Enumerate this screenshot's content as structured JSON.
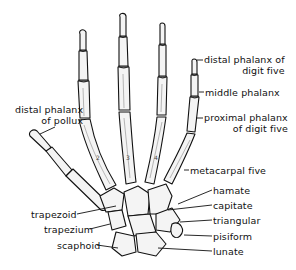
{
  "diagram": {
    "labels": [
      {
        "id": "distal-phalanx-digit-five",
        "line1": "distal phalanx of",
        "line2": "digit five",
        "x": 204,
        "y": 54
      },
      {
        "id": "middle-phalanx",
        "line1": "middle phalanx",
        "line2": "",
        "x": 205,
        "y": 87
      },
      {
        "id": "proximal-phalanx-digit-five",
        "line1": "proximal phalanx",
        "line2": "of digit five",
        "x": 204,
        "y": 112
      },
      {
        "id": "distal-phalanx-pollux",
        "line1": "distal phalanx",
        "line2": "of pollux",
        "x": 15,
        "y": 104
      },
      {
        "id": "metacarpal-five",
        "line1": "metacarpal five",
        "line2": "",
        "x": 190,
        "y": 165
      },
      {
        "id": "hamate",
        "line1": "hamate",
        "line2": "",
        "x": 213,
        "y": 185
      },
      {
        "id": "capitate",
        "line1": "capitate",
        "line2": "",
        "x": 213,
        "y": 200
      },
      {
        "id": "triangular",
        "line1": "triangular",
        "line2": "",
        "x": 213,
        "y": 215
      },
      {
        "id": "pisiform",
        "line1": "pisiform",
        "line2": "",
        "x": 213,
        "y": 231
      },
      {
        "id": "lunate",
        "line1": "lunate",
        "line2": "",
        "x": 213,
        "y": 246
      },
      {
        "id": "trapezoid",
        "line1": "trapezoid",
        "line2": "",
        "x": 31,
        "y": 209
      },
      {
        "id": "trapezium",
        "line1": "trapezium",
        "line2": "",
        "x": 44,
        "y": 224
      },
      {
        "id": "scaphoid",
        "line1": "scaphoid",
        "line2": "",
        "x": 57,
        "y": 240
      }
    ],
    "metacarpal_numbers": [
      "2",
      "3",
      "4"
    ],
    "colors": {
      "ink": "#111111",
      "bone_fill": "#f4f4f4",
      "shade": "#9a9a9a",
      "background": "#ffffff"
    }
  }
}
